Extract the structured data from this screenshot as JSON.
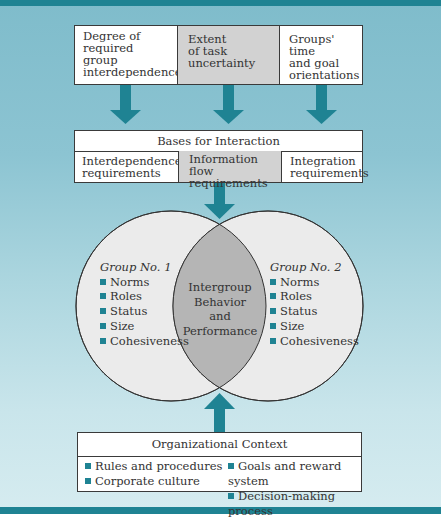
{
  "colors": {
    "accent_teal": "#1f8393",
    "background_top": "#7fbccb",
    "background_bottom": "#d6ecf0",
    "shaded_cell": "#d2d2d2",
    "circle_fill": "#ebebeb",
    "intersection_fill": "#b5b5b5"
  },
  "top_factors": [
    {
      "lines": [
        "Degree of",
        "required",
        "group",
        "interdependence"
      ],
      "shaded": false
    },
    {
      "lines": [
        "Extent",
        "of task",
        "uncertainty"
      ],
      "shaded": true
    },
    {
      "lines": [
        "Groups' time",
        "and goal",
        "orientations"
      ],
      "shaded": false
    }
  ],
  "bases": {
    "title": "Bases for Interaction",
    "items": [
      {
        "lines": [
          "Interdependence",
          "requirements"
        ],
        "shaded": false
      },
      {
        "lines": [
          "Information flow",
          "requirements"
        ],
        "shaded": true
      },
      {
        "lines": [
          "Integration",
          "requirements"
        ],
        "shaded": false
      }
    ]
  },
  "venn": {
    "group1": {
      "title": "Group No. 1",
      "items": [
        "Norms",
        "Roles",
        "Status",
        "Size",
        "Cohesiveness"
      ]
    },
    "group2": {
      "title": "Group No. 2",
      "items": [
        "Norms",
        "Roles",
        "Status",
        "Size",
        "Cohesiveness"
      ]
    },
    "intersection": [
      "Intergroup",
      "Behavior",
      "and",
      "Performance"
    ]
  },
  "org_context": {
    "title": "Organizational Context",
    "left_items": [
      "Rules and procedures",
      "Corporate culture"
    ],
    "right_items": [
      "Goals and reward system",
      "Decision-making process"
    ]
  },
  "icons": {
    "arrow_down": "arrow-down-icon",
    "arrow_up": "arrow-up-icon",
    "bullet": "square-bullet-icon"
  }
}
